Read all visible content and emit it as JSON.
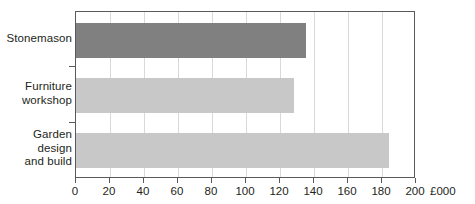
{
  "chart_data": {
    "type": "bar",
    "orientation": "horizontal",
    "title": "",
    "xlabel": "£000",
    "ylabel": "",
    "categories": [
      "Stonemason",
      "Furniture workshop",
      "Garden design and build"
    ],
    "category_lines": [
      [
        "Stonemason"
      ],
      [
        "Furniture",
        "workshop"
      ],
      [
        "Garden",
        "design",
        "and build"
      ]
    ],
    "values": [
      135,
      128,
      184
    ],
    "bar_colors": [
      "#808080",
      "#c8c8c8",
      "#c8c8c8"
    ],
    "xlim": [
      0,
      200
    ],
    "xticks": [
      0,
      20,
      40,
      60,
      80,
      100,
      120,
      140,
      160,
      180,
      200
    ],
    "xtick_labels": [
      "0",
      "20",
      "40",
      "60",
      "80",
      "100",
      "120",
      "140",
      "160",
      "180",
      "200"
    ],
    "unit_suffix": "£000",
    "grid": "vertical",
    "legend": "none",
    "frame_color": "#58595b",
    "gridline_color": "#d9d9d9",
    "background": "#ffffff"
  }
}
